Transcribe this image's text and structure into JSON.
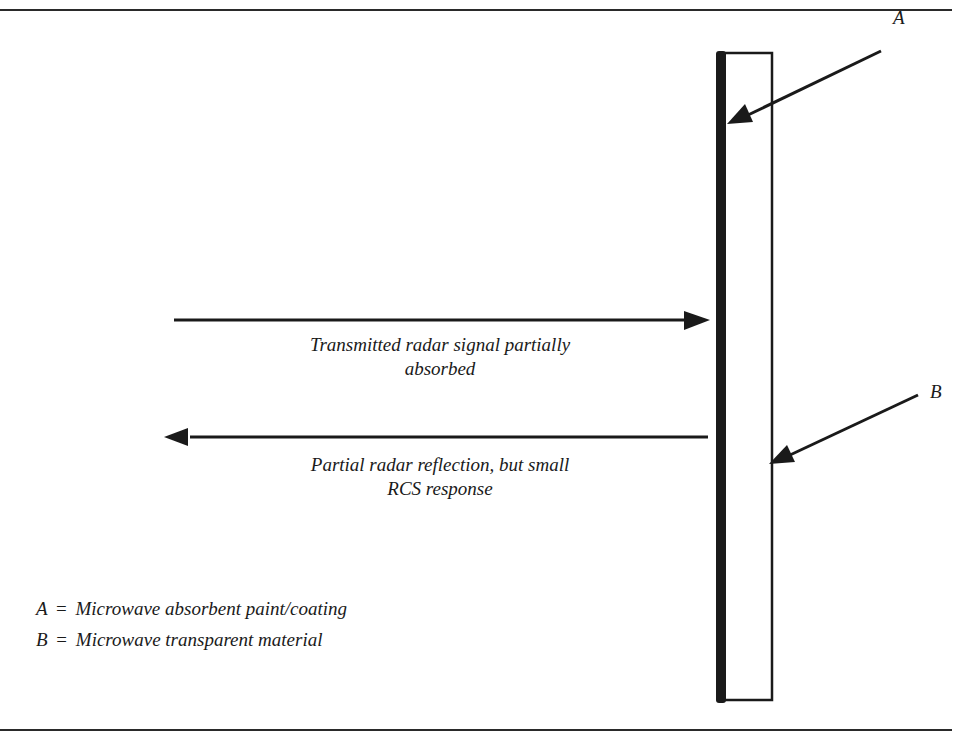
{
  "diagram": {
    "labels": {
      "callout_a": "A",
      "callout_b": "B",
      "transmitted_line1": "Transmitted radar signal partially",
      "transmitted_line2": "absorbed",
      "reflection_line1": "Partial radar reflection, but small",
      "reflection_line2": "RCS response"
    },
    "legend": [
      {
        "key": "A",
        "sep": "=",
        "description": "Microwave absorbent paint/coating"
      },
      {
        "key": "B",
        "sep": "=",
        "description": "Microwave transparent material"
      }
    ],
    "elements": {
      "panel": "microwave transparent material slab with absorbent coating on front face",
      "arrows": [
        "transmitted-signal-arrow (right)",
        "reflected-signal-arrow (left)",
        "callout-a-arrow",
        "callout-b-arrow"
      ]
    },
    "colors": {
      "ink": "#1a1a1a",
      "background": "#ffffff"
    }
  }
}
